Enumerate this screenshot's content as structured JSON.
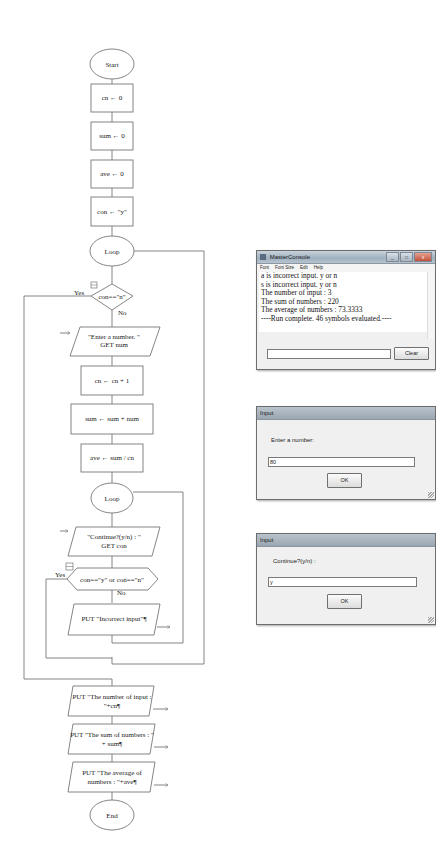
{
  "flowchart": {
    "start": "Start",
    "init": [
      "cn ← 0",
      "sum ← 0",
      "ave ← 0",
      "con ← \"y\""
    ],
    "outer_loop": "Loop",
    "outer_cond": "con==\"n\"",
    "yes": "Yes",
    "no": "No",
    "input_num": [
      "\"Enter a number. \"",
      "GET num"
    ],
    "inc_cn": "cn ← cn + 1",
    "add_sum": "sum ← sum + num",
    "calc_ave": "ave ← sum / cn",
    "inner_loop": "Loop",
    "input_con": [
      "\"Continue?(y/n) : \"",
      "GET con"
    ],
    "inner_cond": "con==\"y\" or con==\"n\"",
    "put_incorrect": "PUT \"Incorrect input\"¶",
    "put_count": [
      "PUT \"The number of input :",
      "\"+cn¶"
    ],
    "put_sum": [
      "PUT \"The sum of numbers : \"",
      "+ sum¶"
    ],
    "put_ave": [
      "PUT \"The average of",
      "numbers : \"+ave¶"
    ],
    "end": "End"
  },
  "console": {
    "title": "MasterConsole",
    "menu": [
      "Font",
      "Font Size",
      "Edit",
      "Help"
    ],
    "lines": [
      "a is incorrect input. y or n",
      "s is incorrect input. y or n",
      "The number of input : 3",
      "The sum of numbers : 220",
      "The average of numbers : 73.3333",
      "----Run complete.  46 symbols evaluated.----"
    ],
    "input_value": "",
    "clear_label": "Clear"
  },
  "dialog_number": {
    "title": "Input",
    "prompt": "Enter a number:",
    "value": "80",
    "ok_label": "OK"
  },
  "dialog_continue": {
    "title": "Input",
    "prompt": "Continue?(y/n) :",
    "value": "y",
    "ok_label": "OK"
  }
}
